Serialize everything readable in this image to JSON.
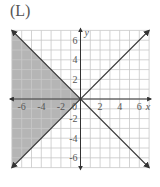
{
  "panel_label": "(L)",
  "chart_data": {
    "type": "line",
    "title": "(L)",
    "xlabel": "x",
    "ylabel": "y",
    "xlim": [
      -7,
      7
    ],
    "ylim": [
      -7,
      7
    ],
    "grid": true,
    "x_ticks": [
      -6,
      -4,
      -2,
      0,
      2,
      4,
      6
    ],
    "y_ticks": [
      -6,
      -4,
      -2,
      2,
      4,
      6
    ],
    "x_tick_labels": [
      "-6",
      "-4",
      "-2",
      "0",
      "2",
      "4",
      "6"
    ],
    "y_tick_labels": [
      "6",
      "4",
      "2",
      "-2",
      "-4",
      "-6"
    ],
    "series": [
      {
        "name": "y = x",
        "x": [
          -7,
          7
        ],
        "y": [
          -7,
          7
        ]
      },
      {
        "name": "y = -x",
        "x": [
          -7,
          7
        ],
        "y": [
          7,
          -7
        ]
      }
    ],
    "shaded_region": {
      "description": "region where y < -x and y > x (left wedge)",
      "vertices": [
        [
          -7,
          7
        ],
        [
          0,
          0
        ],
        [
          -7,
          -7
        ]
      ],
      "color": "#b0b0b0"
    },
    "colors": {
      "line": "#333333",
      "grid": "#c8c8c8",
      "shade": "#b5b5b5"
    }
  }
}
